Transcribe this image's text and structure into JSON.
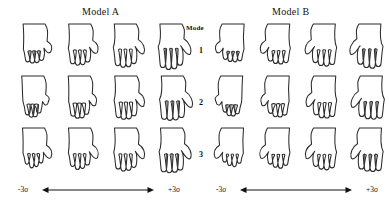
{
  "figure": {
    "background_color": "#ffffff",
    "stroke_color": "#2a2a2a",
    "mode_label": "Mode",
    "mode_numbers": [
      "1",
      "2",
      "3"
    ],
    "panels": [
      {
        "id": "a",
        "title": "Model A",
        "axis": {
          "low_label": "-3σ",
          "high_label": "+3σ",
          "arrow": "double-headed-horizontal"
        },
        "columns": 4,
        "rows": 3
      },
      {
        "id": "b",
        "title": "Model B",
        "axis": {
          "low_label": "-3σ",
          "high_label": "+3σ",
          "arrow": "double-headed-horizontal"
        },
        "columns": 4,
        "rows": 3
      }
    ]
  },
  "chart_data": {
    "type": "diagram",
    "title": "",
    "panels": [
      "Model A",
      "Model B"
    ],
    "row_variable": "Mode",
    "row_values": [
      1,
      2,
      3
    ],
    "column_variable": "Standard deviations from mean shape",
    "column_values": [
      -3,
      -1,
      1,
      3
    ],
    "column_axis_labels": [
      "-3σ",
      "+3σ"
    ],
    "cell_content": "hand outline contour",
    "legend": "none",
    "grid": false
  }
}
